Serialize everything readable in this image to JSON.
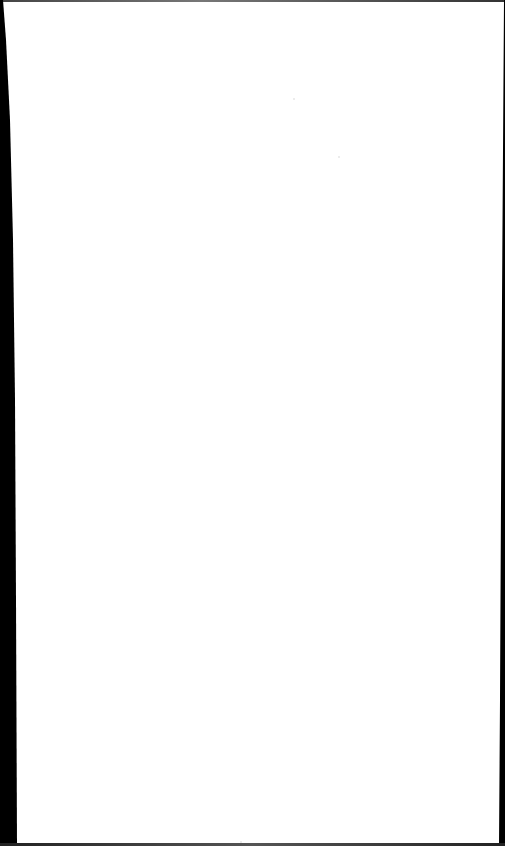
{
  "document": {
    "content": "",
    "blank_page": true
  },
  "colors": {
    "paper": "#ffffff",
    "scan_edge": "#000000"
  }
}
